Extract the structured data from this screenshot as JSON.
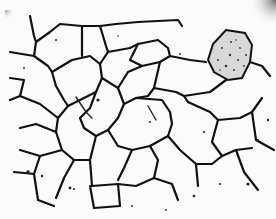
{
  "image": {
    "subject": "micrograph of polycrystalline grain structure",
    "background_color": "#fbfbfb",
    "boundary_color": "#111111",
    "features": [
      "grain-boundaries",
      "dark pitted grain (upper right)",
      "shaded corners (top-left, top-right)",
      "scattered inclusions"
    ]
  }
}
